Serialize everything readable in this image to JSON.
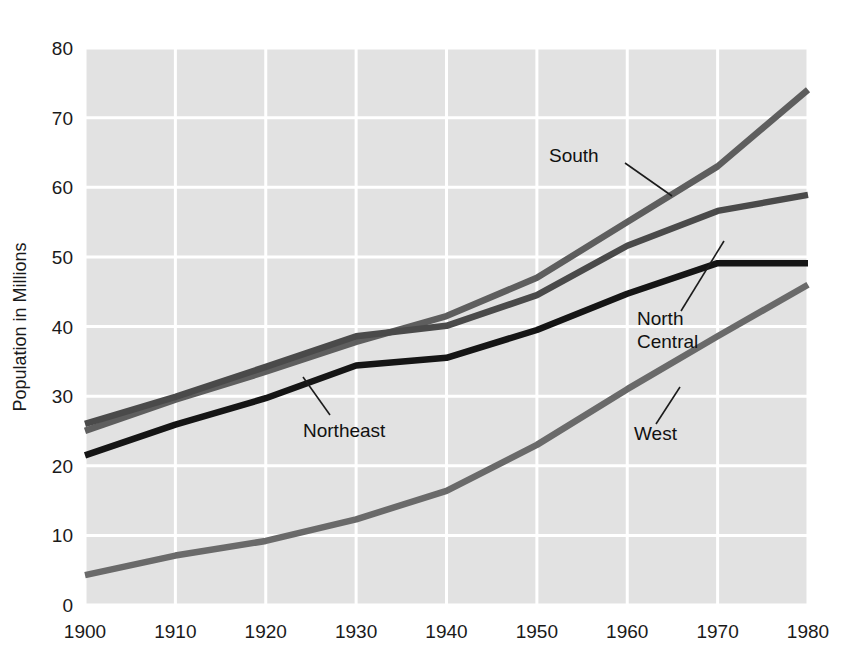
{
  "chart_data": {
    "type": "line",
    "title": "",
    "xlabel": "",
    "ylabel": "Population in Millions",
    "x": [
      1900,
      1910,
      1920,
      1930,
      1940,
      1950,
      1960,
      1970,
      1980
    ],
    "xticklabels": [
      "1900",
      "1910",
      "1920",
      "1930",
      "1940",
      "1950",
      "1960",
      "1970",
      "1980"
    ],
    "yticklabels": [
      "0",
      "10",
      "20",
      "30",
      "40",
      "50",
      "60",
      "70",
      "80"
    ],
    "xlim": [
      1900,
      1980
    ],
    "ylim": [
      0,
      80
    ],
    "ytick_step": 10,
    "grid": true,
    "grid_color": "#ffffff",
    "plot_background": "#e2e2e2",
    "legend": "inline-annotations",
    "series": [
      {
        "name": "South",
        "color": "#5e5e5e",
        "values": [
          25.0,
          29.5,
          33.5,
          37.8,
          41.5,
          47.0,
          55.0,
          63.0,
          74.0
        ]
      },
      {
        "name": "North Central",
        "color": "#4a4a4a",
        "values": [
          26.0,
          29.9,
          34.2,
          38.6,
          40.1,
          44.5,
          51.6,
          56.6,
          58.9
        ]
      },
      {
        "name": "Northeast",
        "color": "#151515",
        "values": [
          21.5,
          25.9,
          29.7,
          34.4,
          35.5,
          39.5,
          44.7,
          49.1,
          49.1
        ]
      },
      {
        "name": "West",
        "color": "#6a6a6a",
        "values": [
          4.3,
          7.1,
          9.2,
          12.3,
          16.4,
          23.0,
          31.0,
          38.6,
          46.0
        ]
      }
    ],
    "annotations": [
      {
        "text": "South",
        "x": 1960,
        "y": 60.5
      },
      {
        "text": "North",
        "x": 1962,
        "y": 44.5
      },
      {
        "text": "Central",
        "x": 1962,
        "y": 41.5
      },
      {
        "text": "Northeast",
        "x": 1929,
        "y": 26.5
      },
      {
        "text": "West",
        "x": 1963,
        "y": 26.5
      }
    ]
  },
  "axes": {
    "y_title": "Population in Millions",
    "y_ticks": [
      "80",
      "70",
      "60",
      "50",
      "40",
      "30",
      "20",
      "10",
      "0"
    ],
    "x_ticks": [
      "1900",
      "1910",
      "1920",
      "1930",
      "1940",
      "1950",
      "1960",
      "1970",
      "1980"
    ]
  },
  "labels": {
    "south": "South",
    "north": "North",
    "central": "Central",
    "northeast": "Northeast",
    "west": "West"
  }
}
